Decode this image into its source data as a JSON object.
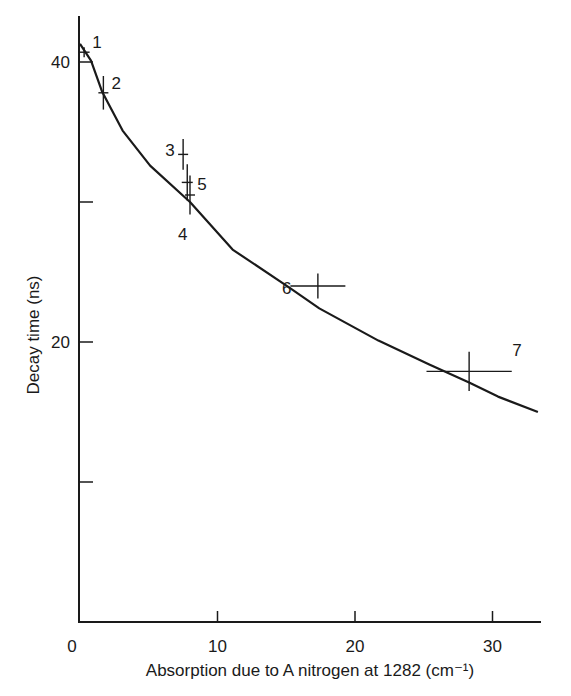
{
  "chart_data": {
    "type": "scatter",
    "title": "",
    "xlabel": "Absorption due to A nitrogen at 1282 (cm⁻¹)",
    "ylabel": "Decay time (ns)",
    "xlim": [
      0,
      33
    ],
    "ylim": [
      0,
      44
    ],
    "x_ticks": [
      0,
      10,
      20,
      30
    ],
    "x_tick_labels": [
      "0",
      "10",
      "20",
      "30"
    ],
    "y_ticks": [
      10,
      20,
      30,
      40
    ],
    "y_tick_labels": [
      "",
      "20",
      "",
      "40"
    ],
    "grid": false,
    "legend": null,
    "series": [
      {
        "name": "Measured points (with error bars)",
        "type": "scatter",
        "points": [
          {
            "label": "1",
            "x": 0.3,
            "y": 40.7,
            "xerr": 0.4,
            "yerr": 0.3
          },
          {
            "label": "2",
            "x": 1.7,
            "y": 37.8,
            "xerr": 0.3,
            "yerr": 1.2
          },
          {
            "label": "3",
            "x": 7.5,
            "y": 33.4,
            "xerr": 0.3,
            "yerr": 1.1
          },
          {
            "label": "4",
            "x": 8.0,
            "y": 30.5,
            "xerr": 0.0,
            "yerr": 1.4
          },
          {
            "label": "5",
            "x": 7.8,
            "y": 31.4,
            "xerr": 0.4,
            "yerr": 1.3
          },
          {
            "label": "6",
            "x": 17.3,
            "y": 24.0,
            "xerr": 2.0,
            "yerr": 0.9
          },
          {
            "label": "7",
            "x": 28.3,
            "y": 17.9,
            "xerr": 3.1,
            "yerr": 1.4
          }
        ]
      },
      {
        "name": "Fitted curve",
        "type": "line",
        "x": [
          0.0,
          0.8,
          1.6,
          3.1,
          5.1,
          8.0,
          11.1,
          15.2,
          17.4,
          21.7,
          25.4,
          28.3,
          30.4,
          33.3
        ],
        "y": [
          41.3,
          40.1,
          37.9,
          35.1,
          32.6,
          30.0,
          26.6,
          23.9,
          22.4,
          20.1,
          18.4,
          17.1,
          16.1,
          15.0
        ]
      }
    ],
    "annotations": [
      "1",
      "2",
      "3",
      "4",
      "5",
      "6",
      "7"
    ]
  }
}
